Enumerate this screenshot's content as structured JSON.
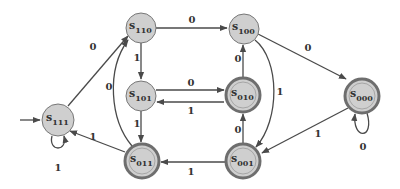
{
  "diagram": {
    "type": "state-machine",
    "colors": {
      "node_fill": "#cfcfcf",
      "edge": "#4a4a4a",
      "text": "#333333"
    },
    "states": [
      {
        "id": "s111",
        "base": "s",
        "sub": "111",
        "accepting": false,
        "initial": true
      },
      {
        "id": "s110",
        "base": "s",
        "sub": "110",
        "accepting": false
      },
      {
        "id": "s101",
        "base": "s",
        "sub": "101",
        "accepting": false
      },
      {
        "id": "s100",
        "base": "s",
        "sub": "100",
        "accepting": false
      },
      {
        "id": "s010",
        "base": "s",
        "sub": "010",
        "accepting": true
      },
      {
        "id": "s000",
        "base": "s",
        "sub": "000",
        "accepting": true
      },
      {
        "id": "s011",
        "base": "s",
        "sub": "011",
        "accepting": true
      },
      {
        "id": "s001",
        "base": "s",
        "sub": "001",
        "accepting": true
      }
    ],
    "transitions": [
      {
        "from": "s111",
        "to": "s111",
        "label": "1"
      },
      {
        "from": "s111",
        "to": "s110",
        "label": "0"
      },
      {
        "from": "s110",
        "to": "s100",
        "label": "0"
      },
      {
        "from": "s110",
        "to": "s101",
        "label": "1"
      },
      {
        "from": "s101",
        "to": "s010",
        "label": "0"
      },
      {
        "from": "s010",
        "to": "s101",
        "label": "1"
      },
      {
        "from": "s101",
        "to": "s011",
        "label": "1"
      },
      {
        "from": "s011",
        "to": "s110",
        "label": "0"
      },
      {
        "from": "s011",
        "to": "s111",
        "label": "1"
      },
      {
        "from": "s010",
        "to": "s100",
        "label": "0"
      },
      {
        "from": "s100",
        "to": "s000",
        "label": "0"
      },
      {
        "from": "s100",
        "to": "s001",
        "label": "1"
      },
      {
        "from": "s001",
        "to": "s010",
        "label": "0"
      },
      {
        "from": "s001",
        "to": "s011",
        "label": "1"
      },
      {
        "from": "s000",
        "to": "s001",
        "label": "1"
      },
      {
        "from": "s000",
        "to": "s000",
        "label": "0"
      }
    ]
  }
}
